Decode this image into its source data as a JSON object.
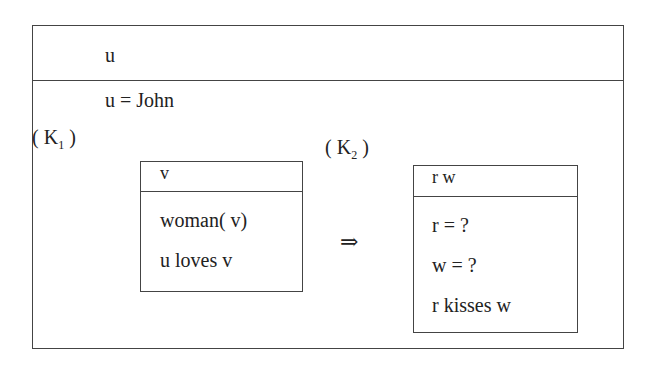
{
  "outer_drs": {
    "universe": "u",
    "conditions": [
      "u = John"
    ]
  },
  "k1": {
    "label": "K",
    "subscript": "1",
    "universe": "v",
    "conditions": [
      "woman( v)",
      "u loves v"
    ]
  },
  "implication_symbol": "⇒",
  "k2": {
    "label": "K",
    "subscript": "2",
    "universe": "r w",
    "conditions": [
      "r = ?",
      "w = ?",
      "r kisses w"
    ]
  }
}
